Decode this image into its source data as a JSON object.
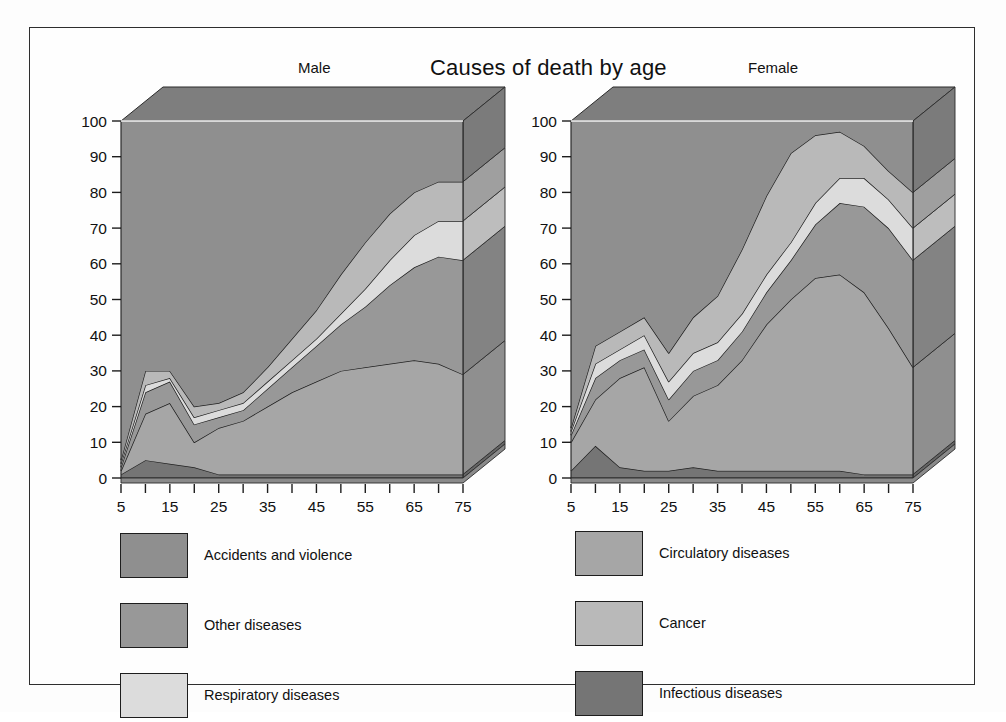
{
  "figure": {
    "main_title": "Causes of death by age",
    "panels": [
      {
        "key": "male",
        "title": "Male"
      },
      {
        "key": "female",
        "title": "Female"
      }
    ]
  },
  "legend": {
    "left_column": [
      {
        "label": "Accidents and violence",
        "color": "#8f8f8f"
      },
      {
        "label": "Other diseases",
        "color": "#989898"
      },
      {
        "label": "Respiratory diseases",
        "color": "#dcdcdc"
      }
    ],
    "right_column": [
      {
        "label": "Circulatory diseases",
        "color": "#a6a6a6"
      },
      {
        "label": "Cancer",
        "color": "#b9b9b9"
      },
      {
        "label": "Infectious diseases",
        "color": "#757575"
      }
    ]
  },
  "axes": {
    "y_ticks": [
      0,
      10,
      20,
      30,
      40,
      50,
      60,
      70,
      80,
      90,
      100
    ],
    "y_min": 0,
    "y_max": 100,
    "x_labels": [
      5,
      15,
      25,
      35,
      45,
      55,
      65,
      75
    ],
    "x_minor_ticks": [
      5,
      10,
      15,
      20,
      25,
      30,
      35,
      40,
      45,
      50,
      55,
      60,
      65,
      70,
      75
    ],
    "x_min": 5,
    "x_max": 75,
    "grid": false
  },
  "chart_data": {
    "type": "area",
    "title": "Causes of death by age",
    "xlabel": "",
    "ylabel": "",
    "ylim": [
      0,
      100
    ],
    "xlim": [
      5,
      75
    ],
    "stacked": true,
    "percent": true,
    "legend_position": "below",
    "panels": [
      {
        "name": "Male",
        "x": [
          5,
          10,
          15,
          20,
          25,
          30,
          35,
          40,
          45,
          50,
          55,
          60,
          65,
          70,
          75
        ],
        "series": [
          {
            "name": "Infectious diseases",
            "color": "#757575",
            "values": [
              1,
              5,
              4,
              3,
              1,
              1,
              1,
              1,
              1,
              1,
              1,
              1,
              1,
              1,
              1
            ]
          },
          {
            "name": "Circulatory diseases",
            "color": "#a6a6a6",
            "values": [
              1,
              13,
              17,
              7,
              13,
              15,
              19,
              23,
              26,
              29,
              30,
              31,
              32,
              31,
              28
            ]
          },
          {
            "name": "Other diseases",
            "color": "#989898",
            "values": [
              1,
              6,
              6,
              5,
              3,
              3,
              5,
              7,
              10,
              13,
              17,
              22,
              26,
              30,
              32
            ]
          },
          {
            "name": "Respiratory diseases",
            "color": "#dcdcdc",
            "values": [
              1,
              2,
              1,
              2,
              2,
              2,
              2,
              2,
              2,
              3,
              5,
              7,
              9,
              10,
              11
            ]
          },
          {
            "name": "Cancer",
            "color": "#b9b9b9",
            "values": [
              1,
              4,
              2,
              3,
              2,
              3,
              4,
              6,
              8,
              11,
              13,
              13,
              12,
              11,
              11
            ]
          },
          {
            "name": "Accidents and violence",
            "color": "#8f8f8f",
            "values": [
              95,
              70,
              70,
              80,
              79,
              76,
              69,
              61,
              53,
              43,
              34,
              26,
              20,
              17,
              17
            ]
          }
        ],
        "cumulative_top_boundaries": {
          "Infectious diseases": [
            1,
            5,
            4,
            3,
            1,
            1,
            1,
            1,
            1,
            1,
            1,
            1,
            1,
            1,
            1
          ],
          "Circulatory diseases": [
            2,
            18,
            21,
            10,
            14,
            16,
            20,
            24,
            27,
            30,
            31,
            32,
            33,
            32,
            29
          ],
          "Other diseases": [
            3,
            24,
            27,
            15,
            17,
            19,
            25,
            31,
            37,
            43,
            48,
            54,
            59,
            62,
            61
          ],
          "Respiratory diseases": [
            4,
            26,
            28,
            17,
            19,
            21,
            27,
            33,
            39,
            46,
            53,
            61,
            68,
            72,
            72
          ],
          "Cancer": [
            5,
            30,
            30,
            20,
            21,
            24,
            31,
            39,
            47,
            57,
            66,
            74,
            80,
            83,
            83
          ],
          "Accidents and violence": [
            100,
            100,
            100,
            100,
            100,
            100,
            100,
            100,
            100,
            100,
            100,
            100,
            100,
            100,
            100
          ]
        }
      },
      {
        "name": "Female",
        "x": [
          5,
          10,
          15,
          20,
          25,
          30,
          35,
          40,
          45,
          50,
          55,
          60,
          65,
          70,
          75
        ],
        "series": [
          {
            "name": "Infectious diseases",
            "color": "#757575",
            "values": [
              2,
              9,
              3,
              2,
              2,
              3,
              2,
              2,
              2,
              2,
              2,
              2,
              1,
              1,
              1
            ]
          },
          {
            "name": "Circulatory diseases",
            "color": "#a6a6a6",
            "values": [
              8,
              13,
              25,
              26,
              14,
              20,
              24,
              31,
              41,
              48,
              54,
              55,
              51,
              41,
              30
            ]
          },
          {
            "name": "Other diseases",
            "color": "#989898",
            "values": [
              2,
              6,
              5,
              5,
              6,
              7,
              7,
              8,
              9,
              11,
              15,
              20,
              24,
              28,
              30
            ]
          },
          {
            "name": "Respiratory diseases",
            "color": "#dcdcdc",
            "values": [
              1,
              4,
              3,
              4,
              5,
              5,
              5,
              5,
              5,
              5,
              6,
              7,
              8,
              8,
              9
            ]
          },
          {
            "name": "Cancer",
            "color": "#b9b9b9",
            "values": [
              1,
              5,
              5,
              5,
              8,
              10,
              13,
              18,
              22,
              25,
              19,
              13,
              9,
              8,
              10
            ]
          },
          {
            "name": "Accidents and violence",
            "color": "#8f8f8f",
            "values": [
              86,
              63,
              59,
              58,
              65,
              55,
              49,
              36,
              21,
              9,
              4,
              3,
              7,
              14,
              20
            ]
          }
        ],
        "cumulative_top_boundaries": {
          "Infectious diseases": [
            2,
            9,
            3,
            2,
            2,
            3,
            2,
            2,
            2,
            2,
            2,
            2,
            1,
            1,
            1
          ],
          "Circulatory diseases": [
            10,
            22,
            28,
            31,
            16,
            23,
            26,
            33,
            43,
            50,
            56,
            57,
            52,
            42,
            31
          ],
          "Other diseases": [
            12,
            28,
            33,
            36,
            22,
            30,
            33,
            41,
            52,
            61,
            71,
            77,
            76,
            70,
            61
          ],
          "Respiratory diseases": [
            13,
            32,
            36,
            40,
            27,
            35,
            38,
            46,
            57,
            66,
            77,
            84,
            84,
            78,
            70
          ],
          "Cancer": [
            14,
            37,
            41,
            45,
            35,
            45,
            51,
            64,
            79,
            91,
            96,
            97,
            93,
            86,
            80
          ],
          "Accidents and violence": [
            100,
            100,
            100,
            100,
            100,
            100,
            100,
            100,
            100,
            100,
            100,
            100,
            100,
            100,
            100
          ]
        }
      }
    ]
  }
}
